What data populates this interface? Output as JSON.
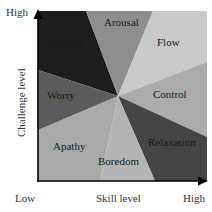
{
  "diagram": {
    "type": "flow-model-quadrant",
    "center": [
      118,
      96
    ],
    "plot": {
      "left": 38,
      "top": 11,
      "right": 207,
      "bottom": 181
    },
    "regions": [
      {
        "name": "Anxiety",
        "color": "#1e1e1e",
        "label_pos": [
          56,
          46
        ],
        "label_fill": "#111111"
      },
      {
        "name": "Arousal",
        "color": "#8e8e8e",
        "label_pos": [
          104,
          26
        ],
        "label_fill": "#1a1a1a"
      },
      {
        "name": "Flow",
        "color": "#c9c9c9",
        "label_pos": [
          158,
          46
        ],
        "label_fill": "#1a1a1a"
      },
      {
        "name": "Control",
        "color": "#ababab",
        "label_pos": [
          152,
          97
        ],
        "label_fill": "#1a1a1a"
      },
      {
        "name": "Relaxation",
        "color": "#454545",
        "label_pos": [
          148,
          145
        ],
        "label_fill": "#111111"
      },
      {
        "name": "Boredom",
        "color": "#b4b4b4",
        "label_pos": [
          98,
          165
        ],
        "label_fill": "#1a1a1a"
      },
      {
        "name": "Apathy",
        "color": "#a9a9a9",
        "label_pos": [
          54,
          150
        ],
        "label_fill": "#1a1a1a"
      },
      {
        "name": "Worry",
        "color": "#5c5c5c",
        "label_pos": [
          48,
          99
        ],
        "label_fill": "#111111"
      }
    ]
  },
  "axes": {
    "x_label": "Skill level",
    "y_label": "Challenge level",
    "x_low": "Low",
    "x_high": "High",
    "y_high": "High"
  }
}
